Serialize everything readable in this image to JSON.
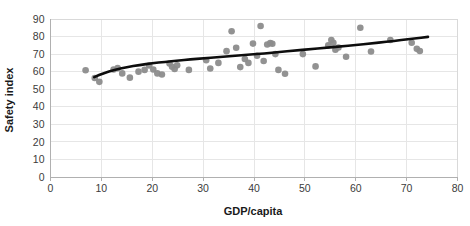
{
  "chart_data": {
    "type": "scatter",
    "title": "",
    "xlabel": "GDP/capita",
    "ylabel": "Safety index",
    "xlim": [
      0,
      80
    ],
    "ylim": [
      0,
      90
    ],
    "xticks": [
      0,
      10,
      20,
      30,
      40,
      50,
      60,
      70,
      80
    ],
    "yticks": [
      0,
      10,
      20,
      30,
      40,
      50,
      60,
      70,
      80,
      90
    ],
    "grid": true,
    "legend": "none",
    "marker_color": "#8c8c8c",
    "trend_color": "#0d0d0d",
    "gridline_color": "#e6e6e6",
    "series": [
      {
        "name": "Countries",
        "points": [
          [
            6.9,
            60.8
          ],
          [
            8.7,
            56.4
          ],
          [
            9.6,
            54.2
          ],
          [
            12.4,
            61.2
          ],
          [
            13.2,
            62.0
          ],
          [
            14.1,
            59.0
          ],
          [
            15.6,
            56.6
          ],
          [
            17.3,
            60.0
          ],
          [
            18.5,
            61.0
          ],
          [
            19.4,
            63.5
          ],
          [
            20.2,
            61.2
          ],
          [
            21.0,
            59.0
          ],
          [
            21.9,
            58.4
          ],
          [
            23.4,
            64.6
          ],
          [
            23.9,
            62.8
          ],
          [
            24.4,
            61.5
          ],
          [
            24.9,
            63.6
          ],
          [
            27.2,
            61.0
          ],
          [
            30.6,
            66.5
          ],
          [
            31.4,
            61.8
          ],
          [
            33.0,
            65.0
          ],
          [
            34.6,
            71.7
          ],
          [
            35.6,
            83.0
          ],
          [
            36.5,
            73.6
          ],
          [
            37.3,
            62.6
          ],
          [
            38.2,
            67.2
          ],
          [
            38.9,
            65.0
          ],
          [
            39.8,
            76.0
          ],
          [
            40.6,
            69.1
          ],
          [
            41.3,
            86.0
          ],
          [
            41.9,
            66.1
          ],
          [
            42.6,
            75.5
          ],
          [
            43.2,
            76.3
          ],
          [
            43.6,
            75.9
          ],
          [
            44.2,
            70.0
          ],
          [
            44.8,
            61.0
          ],
          [
            46.1,
            58.8
          ],
          [
            49.6,
            70.0
          ],
          [
            52.1,
            63.0
          ],
          [
            54.6,
            75.0
          ],
          [
            55.2,
            78.0
          ],
          [
            55.6,
            76.5
          ],
          [
            56.0,
            72.5
          ],
          [
            56.6,
            73.8
          ],
          [
            58.1,
            68.5
          ],
          [
            60.9,
            85.0
          ],
          [
            63.0,
            71.5
          ],
          [
            66.8,
            78.0
          ],
          [
            71.0,
            76.5
          ],
          [
            72.0,
            73.0
          ],
          [
            72.6,
            71.8
          ]
        ]
      }
    ],
    "trend": {
      "type": "logarithmic",
      "label": "",
      "x_start": 8.6,
      "x_end": 74.2,
      "points": [
        [
          8.6,
          56.9
        ],
        [
          10.5,
          59.3
        ],
        [
          12.5,
          61.0
        ],
        [
          15.0,
          62.6
        ],
        [
          17.5,
          63.8
        ],
        [
          20.0,
          64.8
        ],
        [
          22.5,
          65.6
        ],
        [
          25.0,
          66.3
        ],
        [
          27.5,
          67.0
        ],
        [
          30.0,
          67.6
        ],
        [
          33.0,
          68.3
        ],
        [
          36.0,
          69.0
        ],
        [
          39.0,
          69.7
        ],
        [
          42.0,
          70.4
        ],
        [
          45.0,
          71.2
        ],
        [
          48.0,
          72.0
        ],
        [
          51.0,
          72.8
        ],
        [
          54.0,
          73.6
        ],
        [
          57.0,
          74.4
        ],
        [
          60.0,
          75.2
        ],
        [
          63.0,
          76.1
        ],
        [
          66.0,
          77.0
        ],
        [
          69.0,
          78.0
        ],
        [
          71.5,
          78.9
        ],
        [
          74.2,
          79.8
        ]
      ]
    }
  },
  "axis": {
    "x_title": "GDP/capita",
    "y_title": "Safety index"
  }
}
